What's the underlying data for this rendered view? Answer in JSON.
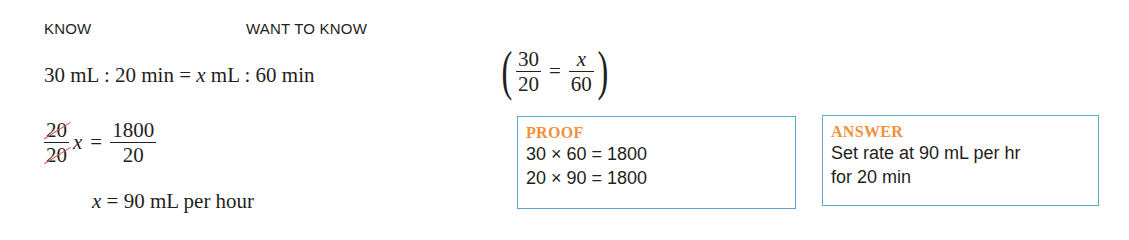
{
  "headers": {
    "know": "KNOW",
    "want_to_know": "WANT TO KNOW"
  },
  "proportion": {
    "left_qty": "30 mL",
    "left_time": "20 min",
    "equals": "=",
    "var": "x",
    "right_unit": "mL",
    "right_time": "60 min",
    "colon": ":"
  },
  "fraction_check": {
    "left_num": "30",
    "left_den": "20",
    "equals": "=",
    "right_num": "x",
    "right_den": "60",
    "open_paren": "(",
    "close_paren": ")"
  },
  "solve": {
    "cancel_num": "20",
    "cancel_den": "20",
    "var": "x",
    "equals": "=",
    "rhs_num": "1800",
    "rhs_den": "20"
  },
  "result": {
    "var": "x",
    "equals": "=",
    "value": "90 mL per hour"
  },
  "proof": {
    "title": "PROOF",
    "lines": [
      "30 × 60 = 1800",
      "20 × 90 = 1800"
    ]
  },
  "answer": {
    "title": "ANSWER",
    "lines": [
      "Set rate at 90 mL per hr",
      "for 20 min"
    ]
  },
  "colors": {
    "box_border": "#5aa7c9",
    "box_title": "#f0913e",
    "cancel_stroke": "#d9534f",
    "text": "#231f20"
  }
}
